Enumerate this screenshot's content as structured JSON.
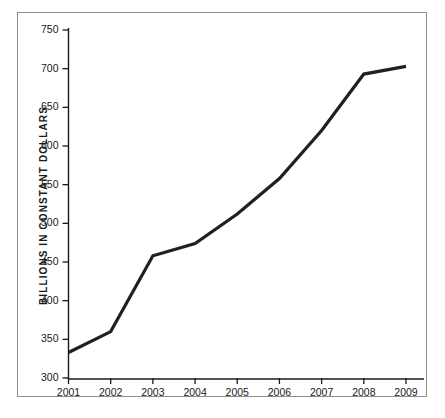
{
  "chart_data": {
    "type": "line",
    "title": "",
    "xlabel": "",
    "ylabel": "BILLIONS IN CONSTANT DOLLARS",
    "categories": [
      "2001",
      "2002",
      "2003",
      "2004",
      "2005",
      "2006",
      "2007",
      "2008",
      "2009"
    ],
    "x": [
      2001,
      2002,
      2003,
      2004,
      2005,
      2006,
      2007,
      2008,
      2009
    ],
    "values": [
      333,
      360,
      458,
      474,
      512,
      558,
      620,
      693,
      703
    ],
    "series": [
      {
        "name": "Spending",
        "values": [
          333,
          360,
          458,
          474,
          512,
          558,
          620,
          693,
          703
        ]
      }
    ],
    "ylim": [
      300,
      750
    ],
    "yticks": [
      300,
      350,
      400,
      450,
      500,
      550,
      600,
      650,
      700,
      750
    ],
    "ytick_labels": [
      "300",
      "350",
      "400",
      "450",
      "500",
      "550",
      "600",
      "650",
      "700",
      "750"
    ],
    "xlim": [
      2001,
      2009
    ],
    "grid": false,
    "legend": false,
    "legend_position": "none",
    "line_color": "#231f20",
    "line_width": 3.2,
    "axis_color": "#1a1a1a",
    "frame_color": "#8e8e8e",
    "background": "#ffffff"
  }
}
